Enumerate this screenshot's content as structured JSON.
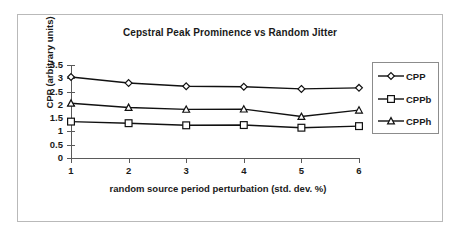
{
  "chart_data": {
    "type": "line",
    "title": "Cepstral Peak Prominence vs Random Jitter",
    "xlabel": "random source period perturbation (std. dev. %)",
    "ylabel": "CPP (arbitrary units)",
    "categories": [
      "1",
      "2",
      "3",
      "4",
      "5",
      "6"
    ],
    "x": [
      1,
      2,
      3,
      4,
      5,
      6
    ],
    "ylim": [
      0,
      3.5
    ],
    "yticks": [
      "0",
      "0.5",
      "1",
      "1.5",
      "2",
      "2.5",
      "3",
      "3.5"
    ],
    "ytick_values": [
      0,
      0.5,
      1,
      1.5,
      2,
      2.5,
      3,
      3.5
    ],
    "grid": false,
    "legend_position": "right",
    "series": [
      {
        "name": "CPP",
        "marker": "diamond",
        "values": [
          3.05,
          2.82,
          2.7,
          2.68,
          2.6,
          2.64
        ]
      },
      {
        "name": "CPPb",
        "marker": "square",
        "values": [
          1.37,
          1.31,
          1.23,
          1.24,
          1.14,
          1.2
        ]
      },
      {
        "name": "CPPh",
        "marker": "triangle",
        "values": [
          2.06,
          1.9,
          1.83,
          1.84,
          1.56,
          1.8
        ]
      }
    ]
  },
  "legend": {
    "entries": [
      {
        "label": "CPP"
      },
      {
        "label": "CPPb"
      },
      {
        "label": "CPPh"
      }
    ]
  },
  "colors": {
    "line": "#111111",
    "axis": "#5a5a5a",
    "frame": "#b9b9b9",
    "text": "#1a1a1a",
    "marker_fill": "#ffffff",
    "background": "#ffffff"
  }
}
